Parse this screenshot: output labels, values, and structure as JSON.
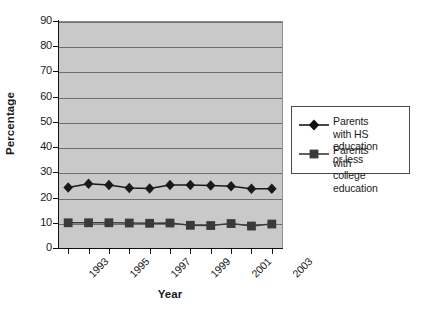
{
  "chart_data": {
    "type": "line",
    "title": "",
    "xlabel": "Year",
    "ylabel": "Percentage",
    "ylim": [
      0,
      90
    ],
    "ytick_step": 10,
    "yticks": [
      0,
      10,
      20,
      30,
      40,
      50,
      60,
      70,
      80,
      90
    ],
    "grid": "horizontal",
    "legend_position": "right",
    "plot_background": "#c9c9c9",
    "page_background": "#ffffff",
    "x": [
      1993,
      1994,
      1995,
      1996,
      1997,
      1998,
      1999,
      2000,
      2001,
      2002,
      2003
    ],
    "categories": [
      "1993",
      "1994",
      "1995",
      "1996",
      "1997",
      "1998",
      "1999",
      "2000",
      "2001",
      "2002",
      "2003"
    ],
    "xtick_labels_shown": [
      "1993",
      "1995",
      "1997",
      "1999",
      "2001",
      "2003"
    ],
    "series": [
      {
        "name": "Parents with HS\neducation or less",
        "name_flat": "Parents with HS education or less",
        "marker": "diamond",
        "color": "#1a1a1a",
        "values": [
          24.0,
          25.5,
          25.0,
          23.8,
          23.6,
          25.0,
          25.0,
          24.8,
          24.5,
          23.5,
          23.5
        ]
      },
      {
        "name": "Parents with\ncollege education",
        "name_flat": "Parents with college education",
        "marker": "square",
        "color": "#3a3a3a",
        "values": [
          10.0,
          10.0,
          10.0,
          9.9,
          9.8,
          9.9,
          9.0,
          8.9,
          9.7,
          8.7,
          9.5
        ]
      }
    ]
  },
  "axis": {
    "y_title": "Percentage",
    "x_title": "Year"
  },
  "legend": {
    "entries": [
      {
        "label": "Parents with HS\neducation or less",
        "marker": "diamond"
      },
      {
        "label": "Parents with\ncollege education",
        "marker": "square"
      }
    ]
  }
}
